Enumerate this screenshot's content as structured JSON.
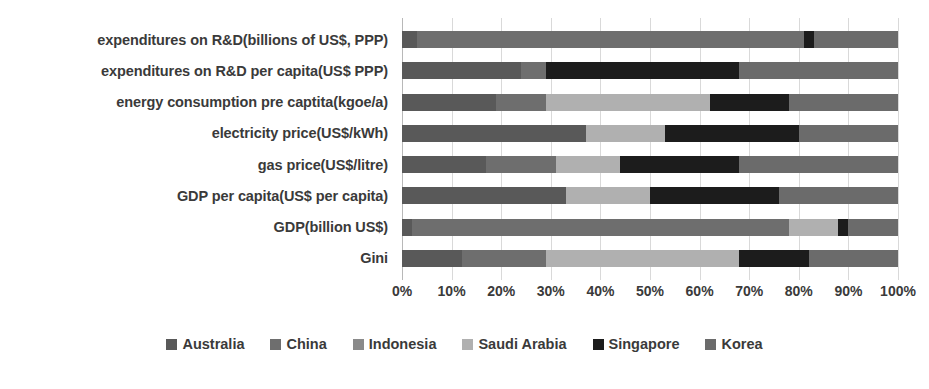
{
  "chart_data": {
    "type": "bar",
    "orientation": "horizontal",
    "stacked": true,
    "normalized": "100%",
    "title": "",
    "subtitle": "",
    "xlabel": "",
    "ylabel": "",
    "xlim": [
      0,
      100
    ],
    "grid": true,
    "legend_position": "bottom",
    "xticks": [
      "0%",
      "10%",
      "20%",
      "30%",
      "40%",
      "50%",
      "60%",
      "70%",
      "80%",
      "90%",
      "100%"
    ],
    "xtick_values": [
      0,
      10,
      20,
      30,
      40,
      50,
      60,
      70,
      80,
      90,
      100
    ],
    "categories": [
      "expenditures on R&D(billions of US$, PPP)",
      "expenditures on R&D per capita(US$ PPP)",
      "energy consumption pre captita(kgoe/a)",
      "electricity price(US$/kWh)",
      "gas price(US$/litre)",
      "GDP per capita(US$ per capita)",
      "GDP(billion US$)",
      "Gini"
    ],
    "series": [
      {
        "name": "Australia",
        "color": "#595959",
        "values": [
          3.0,
          24.0,
          19.0,
          37.0,
          17.0,
          33.0,
          2.0,
          12.0
        ]
      },
      {
        "name": "China",
        "color": "#6e6e6e",
        "values": [
          78.0,
          5.0,
          10.0,
          0.0,
          14.0,
          0.0,
          76.0,
          17.0
        ]
      },
      {
        "name": "Indonesia",
        "color": "#8a8a8a",
        "values": [
          0.0,
          0.0,
          0.0,
          0.0,
          0.0,
          0.0,
          0.0,
          0.0
        ]
      },
      {
        "name": "Saudi Arabia",
        "color": "#b0b0b0",
        "values": [
          0.0,
          0.0,
          33.0,
          16.0,
          13.0,
          17.0,
          10.0,
          39.0
        ]
      },
      {
        "name": "Singapore",
        "color": "#1c1c1c",
        "values": [
          2.0,
          39.0,
          16.0,
          27.0,
          24.0,
          26.0,
          2.0,
          14.0
        ]
      },
      {
        "name": "Korea",
        "color": "#6b6b6b",
        "values": [
          17.0,
          32.0,
          22.0,
          20.0,
          32.0,
          24.0,
          10.0,
          18.0
        ]
      }
    ]
  },
  "legend": {
    "items": [
      {
        "label": "Australia",
        "color": "#595959"
      },
      {
        "label": "China",
        "color": "#6e6e6e"
      },
      {
        "label": "Indonesia",
        "color": "#8a8a8a"
      },
      {
        "label": "Saudi Arabia",
        "color": "#b0b0b0"
      },
      {
        "label": "Singapore",
        "color": "#1c1c1c"
      },
      {
        "label": "Korea",
        "color": "#6b6b6b"
      }
    ]
  }
}
